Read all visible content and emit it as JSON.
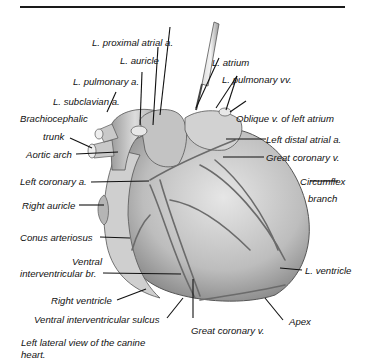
{
  "figure": {
    "caption": "Left lateral view of the canine heart.",
    "labels": {
      "l_proximal_atrial_a": "L. proximal atrial a.",
      "l_auricle": "L. auricle",
      "l_atrium": "L. atrium",
      "l_pulmonary_a": "L. pulmonary a.",
      "l_pulmonary_vv": "L. pulmonary vv.",
      "l_subclavian_a": "L. subclavian a.",
      "oblique_v": "Oblique v. of left atrium",
      "brachiocephalic_1": "Brachiocephalic",
      "brachiocephalic_2": "trunk",
      "left_distal_atrial_a": "Left distal atrial a.",
      "aortic_arch": "Aortic arch",
      "great_coronary_v_top": "Great coronary v.",
      "left_coronary_a": "Left coronary a.",
      "circumflex_1": "Circumflex",
      "circumflex_2": "branch",
      "right_auricle": "Right auricle",
      "conus_arteriosus": "Conus arteriosus",
      "ventral_ivb_1": "Ventral",
      "ventral_ivb_2": "interventricular br.",
      "l_ventricle": "L. ventricle",
      "right_ventricle": "Right ventricle",
      "apex": "Apex",
      "ventral_iv_sulcus": "Ventral interventricular sulcus",
      "great_coronary_v_bottom": "Great coronary v."
    }
  }
}
